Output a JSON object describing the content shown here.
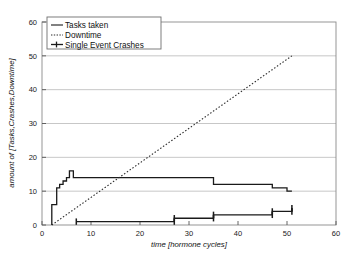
{
  "chart_data": {
    "type": "line",
    "title": "",
    "xlabel": "time [hormone cycles]",
    "ylabel": "amount of [Tasks,Crashes,Downtime]",
    "xlim": [
      0,
      60
    ],
    "ylim": [
      0,
      60
    ],
    "xticks": [
      0,
      10,
      20,
      30,
      40,
      50,
      60
    ],
    "yticks": [
      0,
      10,
      20,
      30,
      40,
      50,
      60
    ],
    "xtick_labels": [
      "0",
      "10",
      "20",
      "30",
      "40",
      "50",
      "60"
    ],
    "ytick_labels": [
      "0",
      "10",
      "20",
      "30",
      "40",
      "50",
      "60"
    ],
    "grid": "horizontal",
    "grid_color": "#b9b9b9",
    "frame_color": "#8a8a8a",
    "legend_position": "top-left",
    "series": [
      {
        "name": "Tasks taken",
        "style": "solid-step",
        "color": "#1a1a1a",
        "marker": "none",
        "points": [
          [
            2,
            0
          ],
          [
            2,
            6
          ],
          [
            3,
            6
          ],
          [
            3,
            11
          ],
          [
            3.6,
            11
          ],
          [
            3.6,
            12
          ],
          [
            4.3,
            12
          ],
          [
            4.3,
            13
          ],
          [
            5,
            13
          ],
          [
            5,
            14
          ],
          [
            5.6,
            14
          ],
          [
            5.6,
            16
          ],
          [
            6.4,
            16
          ],
          [
            6.4,
            14
          ],
          [
            27,
            14
          ],
          [
            27,
            14
          ],
          [
            35,
            14
          ],
          [
            35,
            12
          ],
          [
            47,
            12
          ],
          [
            47,
            11
          ],
          [
            50,
            11
          ],
          [
            50,
            10
          ],
          [
            51,
            10
          ]
        ]
      },
      {
        "name": "Downtime",
        "style": "dotted-line",
        "color": "#2b2b2b",
        "marker": "none",
        "points": [
          [
            2,
            0
          ],
          [
            51,
            50
          ]
        ]
      },
      {
        "name": "Single Event Crashes",
        "style": "solid-step-marker",
        "color": "#1a1a1a",
        "marker": "vertical-bar",
        "points": [
          [
            7,
            1
          ],
          [
            27,
            1
          ],
          [
            27,
            2
          ],
          [
            35,
            2
          ],
          [
            35,
            3
          ],
          [
            47,
            3
          ],
          [
            47,
            4
          ],
          [
            51,
            4
          ],
          [
            51,
            5
          ]
        ],
        "marker_points": [
          [
            7,
            1
          ],
          [
            27,
            1
          ],
          [
            27,
            2
          ],
          [
            35,
            2
          ],
          [
            35,
            3
          ],
          [
            47,
            3
          ],
          [
            47,
            4
          ],
          [
            51,
            4
          ],
          [
            51,
            5
          ]
        ]
      }
    ]
  },
  "legend": {
    "items": [
      {
        "label": "Tasks taken",
        "style": "solid"
      },
      {
        "label": "Downtime",
        "style": "dotted"
      },
      {
        "label": "Single Event Crashes",
        "style": "solid-marker"
      }
    ]
  }
}
